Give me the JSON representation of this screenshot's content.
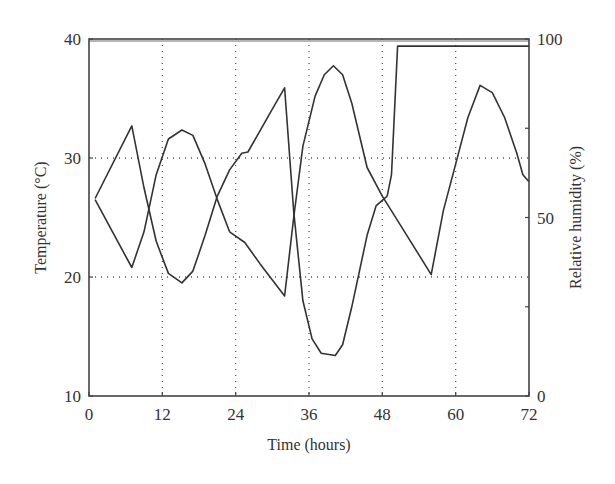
{
  "chart_data": {
    "type": "line",
    "title": "",
    "xlabel": "Time (hours)",
    "ylabel": "Temperature (°C)",
    "y2label": "Relative humidity (%)",
    "xlim": [
      0,
      72
    ],
    "ylim": [
      10,
      40
    ],
    "y2lim": [
      0,
      100
    ],
    "xticks": [
      0,
      12,
      24,
      36,
      48,
      60,
      72
    ],
    "yticks": [
      10,
      20,
      30,
      40
    ],
    "y2ticks": [
      0,
      50,
      100
    ],
    "grid": true,
    "legend": null,
    "series": [
      {
        "name": "Temperature",
        "axis": "left",
        "x": [
          1,
          7,
          9,
          11,
          13,
          15.2,
          17,
          19,
          21,
          23,
          25,
          26,
          28,
          30,
          32,
          33.5,
          35,
          36.5,
          38,
          40.3,
          41.5,
          43,
          45.5,
          47,
          48.8
        ],
        "values": [
          26.6,
          32.7,
          27.5,
          23.0,
          20.3,
          19.5,
          20.5,
          23.5,
          26.8,
          29.0,
          30.4,
          30.5,
          32.3,
          34.1,
          35.9,
          25.5,
          18.0,
          14.8,
          13.6,
          13.4,
          14.3,
          17.5,
          23.5,
          26.0,
          26.8
        ]
      },
      {
        "name": "Relative humidity",
        "axis": "right",
        "x": [
          1,
          7,
          9,
          11,
          13,
          15.2,
          17,
          19,
          21,
          23,
          25.5,
          28,
          32,
          33.5,
          35,
          37,
          38.5,
          40,
          41.5,
          43,
          45.5,
          48,
          52,
          56,
          58,
          60,
          62,
          64,
          66,
          68,
          70,
          71,
          72
        ],
        "values": [
          55,
          36,
          46,
          62,
          72,
          74.5,
          73,
          65,
          55,
          46,
          43,
          37,
          28,
          50,
          70,
          84,
          90,
          92.5,
          90,
          82,
          64,
          56,
          45,
          34,
          52,
          65,
          78,
          87,
          85,
          78,
          68,
          62,
          60
        ]
      },
      {
        "name": "Relative humidity (saturated)",
        "axis": "right",
        "x": [
          48.8,
          49.5,
          50.5,
          72
        ],
        "values": [
          56,
          62,
          98,
          98
        ]
      }
    ]
  },
  "axes": {
    "x_label": "Time (hours)",
    "y_left_label": "Temperature (°C)",
    "y_right_label": "Relative humidity (%)",
    "x_ticks": [
      "0",
      "12",
      "24",
      "36",
      "48",
      "60",
      "72"
    ],
    "y_left_ticks": [
      "10",
      "20",
      "30",
      "40"
    ],
    "y_right_ticks": [
      "0",
      "50",
      "100"
    ]
  },
  "style": {
    "line_color": "#333333",
    "grid_color": "#555555",
    "axis_color": "#444444"
  }
}
